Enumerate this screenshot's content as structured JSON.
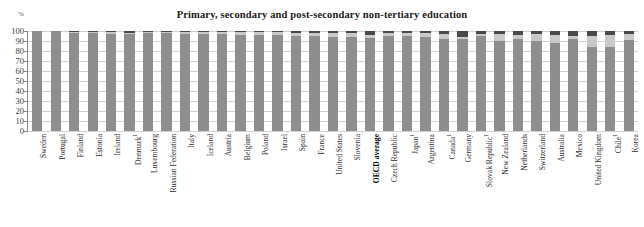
{
  "chart": {
    "title": "Primary, secondary and post-secondary non-tertiary education",
    "unit": "%"
  },
  "chart_data": {
    "type": "bar",
    "stacked": true,
    "title": "Primary, secondary and post-secondary non-tertiary education",
    "xlabel": "",
    "ylabel": "%",
    "ylim": [
      0,
      100
    ],
    "yticks": [
      0,
      10,
      20,
      30,
      40,
      50,
      60,
      70,
      80,
      90,
      100
    ],
    "grid": true,
    "legend_position": "none",
    "highlight_category": "OECD average",
    "colors": {
      "below": "#8e8e8e",
      "mid": "#c9c9c9",
      "top": "#4a4a4a"
    },
    "categories": [
      "Sweden",
      "Portugal",
      "Finland",
      "Estonia",
      "Ireland",
      "Denmark¹",
      "Luxembourg",
      "Russian Federation",
      "Italy",
      "Iceland",
      "Austria",
      "Belgium",
      "Poland",
      "Israel",
      "Spain",
      "France",
      "United States",
      "Slovenia",
      "OECD average",
      "Czech Republic",
      "Japan¹",
      "Argentina",
      "Canada¹",
      "Germany",
      "Slovak Republic¹",
      "New Zealand",
      "Netherlands",
      "Switzerland",
      "Australia",
      "Mexico",
      "United Kingdom",
      "Chile¹",
      "Korea"
    ],
    "footnote_marker": "¹",
    "series": [
      {
        "name": "below",
        "values": [
          100,
          100,
          98,
          98,
          97,
          97,
          98,
          98,
          97,
          97,
          97,
          96,
          96,
          96,
          95,
          95,
          94,
          94,
          93,
          95,
          95,
          94,
          92,
          92,
          95,
          90,
          92,
          90,
          88,
          92,
          84,
          84,
          91
        ]
      },
      {
        "name": "mid",
        "values": [
          0,
          0,
          1,
          1,
          2,
          1,
          1,
          1,
          2,
          2,
          2,
          3,
          3,
          3,
          3,
          3,
          4,
          4,
          3,
          3,
          3,
          4,
          5,
          2,
          2,
          7,
          4,
          7,
          8,
          3,
          11,
          12,
          6
        ]
      },
      {
        "name": "top",
        "values": [
          0,
          0,
          1,
          1,
          1,
          2,
          1,
          1,
          1,
          1,
          1,
          1,
          1,
          1,
          2,
          2,
          2,
          2,
          4,
          2,
          2,
          2,
          3,
          6,
          3,
          3,
          4,
          3,
          4,
          5,
          5,
          4,
          3
        ]
      }
    ]
  }
}
